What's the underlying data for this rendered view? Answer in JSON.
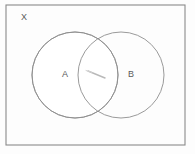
{
  "figure": {
    "type": "venn-diagram",
    "background_color": "#fdfdfd"
  },
  "universal_set": {
    "label": "X",
    "shape": "rectangle",
    "border_color": "#8a8a8a",
    "x": 6,
    "y": 5,
    "width": 179,
    "height": 140
  },
  "sets": [
    {
      "label": "A",
      "shape": "circle",
      "cx": 75,
      "cy": 75,
      "r": 43,
      "stroke_color": "#8f8f8f",
      "fill_color": "#ffffff",
      "label_x": 62,
      "label_y": 70
    },
    {
      "label": "B",
      "shape": "circle",
      "cx": 121,
      "cy": 75,
      "r": 43,
      "stroke_color": "#8f8f8f",
      "fill_color": "#ffffff",
      "label_x": 128,
      "label_y": 70
    }
  ],
  "annotations": [
    {
      "name": "intersection-mark",
      "kind": "pencil-stroke",
      "color": "#b9b9b9",
      "x1": 88,
      "y1": 71,
      "x2": 105,
      "y2": 78
    }
  ],
  "text_color": "#5a5a5a"
}
